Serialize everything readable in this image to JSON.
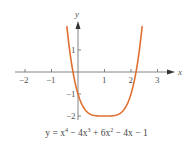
{
  "chart_data": {
    "type": "line",
    "title": "",
    "caption": "y = x⁴ − 4x³ + 6x² − 4x − 1",
    "caption_parts": {
      "lhs": "y = x",
      "p1": "4",
      "t2": " − 4x",
      "p2": "3",
      "t3": " + 6x",
      "p3": "2",
      "t4": " − 4x − 1"
    },
    "xlabel": "x",
    "ylabel": "y",
    "xlim": [
      -2.2,
      3.5
    ],
    "ylim": [
      -2.2,
      2.1
    ],
    "x_ticks": [
      -2,
      -1,
      1,
      2,
      3
    ],
    "x_tick_labels": [
      "−2",
      "−1",
      "1",
      "2",
      "3"
    ],
    "y_ticks": [
      1,
      -1,
      -2
    ],
    "y_tick_labels": [
      "1",
      "−1",
      "−2"
    ],
    "grid": false,
    "legend": "none",
    "series": [
      {
        "name": "y = x^4 - 4x^3 + 6x^2 - 4x - 1",
        "color": "#E07030",
        "x": [
          -0.42,
          -0.2,
          0,
          0.25,
          0.5,
          0.75,
          1,
          1.25,
          1.5,
          1.75,
          2,
          2.2,
          2.42
        ],
        "y": [
          2.0,
          0.07,
          -1.0,
          -1.68,
          -1.94,
          -2.0,
          -2.0,
          -2.0,
          -1.94,
          -1.68,
          -1.0,
          0.07,
          2.0
        ]
      }
    ],
    "annotations": {
      "y_intercept": -1,
      "minimum": [
        1,
        -2
      ],
      "x_intercepts_approx": [
        -0.19,
        2.19
      ]
    }
  },
  "colors": {
    "curve": "#E07030",
    "axis": "#666666",
    "text": "#555555"
  }
}
